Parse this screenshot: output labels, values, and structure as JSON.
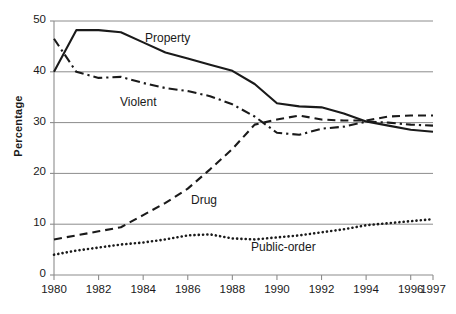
{
  "chart_data": {
    "type": "line",
    "title": "",
    "xlabel": "",
    "ylabel": "Percentage",
    "xlim": [
      1980,
      1997
    ],
    "ylim": [
      0,
      50
    ],
    "yticks": [
      0,
      10,
      20,
      30,
      40,
      50
    ],
    "xticks": [
      1980,
      1982,
      1984,
      1986,
      1988,
      1990,
      1992,
      1994,
      1996,
      1997
    ],
    "grid": "horizontal",
    "legend": "inline-labels",
    "x": [
      1980,
      1981,
      1982,
      1983,
      1984,
      1985,
      1986,
      1987,
      1988,
      1989,
      1990,
      1991,
      1992,
      1993,
      1994,
      1995,
      1996,
      1997
    ],
    "series": [
      {
        "name": "Property",
        "style": "solid",
        "values": [
          40.0,
          48.2,
          48.2,
          47.8,
          45.8,
          43.8,
          42.6,
          41.4,
          40.2,
          37.6,
          33.8,
          33.2,
          33.0,
          31.8,
          30.2,
          29.4,
          28.6,
          28.2
        ]
      },
      {
        "name": "Violent",
        "style": "dash-dot",
        "values": [
          46.5,
          40.0,
          38.8,
          39.0,
          37.8,
          36.8,
          36.2,
          35.2,
          33.6,
          31.2,
          28.0,
          27.6,
          28.8,
          29.2,
          30.2,
          30.0,
          29.6,
          29.4
        ]
      },
      {
        "name": "Drug",
        "style": "dashed",
        "values": [
          7.0,
          7.8,
          8.6,
          9.4,
          11.8,
          14.2,
          17.0,
          20.8,
          24.8,
          29.6,
          30.6,
          31.4,
          30.6,
          30.4,
          30.4,
          31.2,
          31.4,
          31.4
        ]
      },
      {
        "name": "Public-order",
        "style": "dotted",
        "values": [
          4.0,
          4.8,
          5.4,
          6.0,
          6.4,
          7.0,
          7.8,
          8.0,
          7.2,
          7.0,
          7.4,
          7.8,
          8.4,
          9.0,
          9.8,
          10.2,
          10.6,
          11.0
        ]
      }
    ],
    "colors": {
      "line": "#1a1a1a",
      "grid": "#8c8c8c",
      "axis": "#8c8c8c",
      "text": "#1a1a1a",
      "background": "#ffffff"
    },
    "series_label_positions": [
      {
        "name": "Property",
        "x": 145,
        "y": 31
      },
      {
        "name": "Violent",
        "x": 120,
        "y": 95
      },
      {
        "name": "Drug",
        "x": 191,
        "y": 193
      },
      {
        "name": "Public-order",
        "x": 251,
        "y": 240
      }
    ]
  },
  "axis": {
    "y_title": "Percentage",
    "y_labels": [
      "50",
      "40",
      "30",
      "20",
      "10",
      "0"
    ],
    "x_labels": [
      "1980",
      "1982",
      "1984",
      "1986",
      "1988",
      "1990",
      "1992",
      "1994",
      "1996",
      "1997"
    ]
  }
}
